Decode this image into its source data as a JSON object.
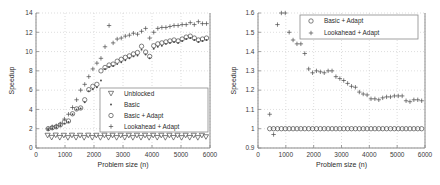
{
  "figure": {
    "title": "",
    "panel_count": 2
  },
  "chart_data": [
    {
      "type": "scatter",
      "panel": "left",
      "title": "",
      "xlabel": "Problem size (n)",
      "ylabel": "Speedup",
      "xlim": [
        0,
        6000
      ],
      "ylim": [
        0,
        14
      ],
      "xticks": [
        0,
        1000,
        2000,
        3000,
        4000,
        5000,
        6000
      ],
      "xticklabels": [
        "0",
        "1000",
        "2000",
        "3000",
        "4000",
        "5000",
        "6000"
      ],
      "yticks": [
        0,
        2,
        4,
        6,
        8,
        10,
        12,
        14
      ],
      "yticklabels": [
        "0",
        "2",
        "4",
        "6",
        "8",
        "10",
        "12",
        "14"
      ],
      "grid": true,
      "legend_position": "lower right",
      "legend": [
        "Unblocked",
        "Basic",
        "Basic + Adapt",
        "Lookahead + Adapt"
      ],
      "markers": [
        "triangle-down",
        "dot",
        "circle",
        "plus"
      ],
      "series": [
        {
          "name": "Unblocked",
          "marker": "triangle-down",
          "x": [
            400,
            540,
            680,
            820,
            960,
            1100,
            1240,
            1380,
            1520,
            1660,
            1800,
            1940,
            2080,
            2220,
            2360,
            2500,
            2640,
            2780,
            2920,
            3060,
            3200,
            3340,
            3480,
            3620,
            3760,
            3900,
            4040,
            4180,
            4320,
            4460,
            4600,
            4740,
            4880,
            5020,
            5160,
            5300,
            5440,
            5580,
            5720,
            5860
          ],
          "y": [
            1.3,
            1.08,
            1.32,
            1.07,
            1.3,
            1.06,
            1.31,
            1.07,
            1.3,
            1.06,
            1.31,
            1.07,
            1.3,
            1.06,
            1.31,
            1.07,
            1.3,
            1.06,
            1.3,
            1.07,
            1.3,
            1.06,
            1.3,
            1.07,
            1.3,
            1.06,
            1.3,
            1.07,
            1.3,
            1.06,
            1.3,
            1.07,
            1.3,
            1.06,
            1.3,
            1.07,
            1.3,
            1.06,
            1.3,
            1.15
          ]
        },
        {
          "name": "Basic",
          "marker": "dot",
          "x": [
            420,
            560,
            700,
            840,
            980,
            1120,
            1260,
            1400,
            1540,
            1680,
            1820,
            1960,
            2100,
            2240,
            2380,
            2520,
            2660,
            2800,
            2940,
            3080,
            3220,
            3360,
            3500,
            3640,
            3780,
            3920,
            4060,
            4200,
            4340,
            4480,
            4620,
            4760,
            4900,
            5040,
            5180,
            5320,
            5460,
            5600,
            5740,
            5880
          ],
          "y": [
            1.9,
            2.0,
            2.1,
            2.3,
            2.55,
            2.7,
            3.5,
            4.0,
            4.1,
            4.75,
            5.9,
            6.1,
            6.3,
            7.0,
            8.2,
            8.4,
            8.5,
            8.7,
            8.9,
            9.1,
            9.3,
            9.5,
            9.6,
            10.2,
            9.7,
            9.3,
            10.3,
            10.5,
            10.6,
            10.8,
            10.9,
            11.0,
            10.9,
            11.1,
            11.3,
            11.4,
            11.2,
            11.0,
            11.1,
            11.2
          ]
        },
        {
          "name": "Basic + Adapt",
          "marker": "circle",
          "x": [
            420,
            560,
            700,
            840,
            980,
            1120,
            1260,
            1400,
            1540,
            1680,
            1820,
            1960,
            2100,
            2240,
            2380,
            2520,
            2660,
            2800,
            2940,
            3080,
            3220,
            3360,
            3500,
            3640,
            3780,
            3920,
            4060,
            4200,
            4340,
            4480,
            4620,
            4760,
            4900,
            5040,
            5180,
            5320,
            5460,
            5600,
            5740,
            5880
          ],
          "y": [
            2.0,
            2.1,
            2.2,
            2.4,
            2.7,
            2.8,
            3.55,
            4.05,
            4.15,
            5.0,
            6.05,
            6.4,
            6.6,
            8.0,
            8.35,
            8.6,
            8.7,
            9.0,
            9.2,
            9.4,
            9.55,
            9.75,
            9.9,
            10.55,
            9.95,
            9.5,
            10.6,
            10.8,
            10.9,
            11.0,
            11.1,
            11.2,
            11.1,
            11.3,
            11.5,
            11.6,
            11.4,
            11.2,
            11.3,
            11.4
          ]
        },
        {
          "name": "Lookahead + Adapt",
          "marker": "plus",
          "x": [
            420,
            560,
            700,
            840,
            980,
            1120,
            1260,
            1400,
            1540,
            1680,
            1820,
            1960,
            2100,
            2240,
            2380,
            2520,
            2660,
            2800,
            2940,
            3080,
            3220,
            3360,
            3500,
            3640,
            3780,
            3920,
            4060,
            4200,
            4340,
            4480,
            4620,
            4760,
            4900,
            5040,
            5180,
            5320,
            5460,
            5600,
            5740,
            5880
          ],
          "y": [
            2.0,
            2.2,
            2.3,
            2.5,
            3.0,
            3.5,
            4.2,
            5.0,
            6.0,
            6.6,
            7.4,
            8.2,
            8.8,
            9.3,
            10.5,
            12.7,
            10.9,
            11.3,
            11.4,
            11.6,
            11.7,
            11.9,
            11.8,
            12.1,
            12.4,
            11.4,
            12.0,
            12.4,
            12.5,
            12.5,
            12.6,
            12.7,
            12.7,
            12.8,
            12.8,
            13.0,
            12.8,
            13.1,
            12.9,
            12.9
          ]
        }
      ]
    },
    {
      "type": "scatter",
      "panel": "right",
      "title": "",
      "xlabel": "Problem size (n)",
      "ylabel": "Speedup",
      "xlim": [
        0,
        6000
      ],
      "ylim": [
        0.9,
        1.6
      ],
      "xticks": [
        0,
        1000,
        2000,
        3000,
        4000,
        5000,
        6000
      ],
      "xticklabels": [
        "0",
        "1000",
        "2000",
        "3000",
        "4000",
        "5000",
        "6000"
      ],
      "yticks": [
        0.9,
        1.0,
        1.1,
        1.2,
        1.3,
        1.4,
        1.5,
        1.6
      ],
      "yticklabels": [
        "0.9",
        "1",
        "1.1",
        "1.2",
        "1.3",
        "1.4",
        "1.5",
        "1.6"
      ],
      "grid": true,
      "legend_position": "upper center",
      "legend": [
        "Basic + Adapt",
        "Lookahead + Adapt"
      ],
      "markers": [
        "circle",
        "plus"
      ],
      "series": [
        {
          "name": "Basic + Adapt",
          "marker": "circle",
          "x": [
            420,
            560,
            700,
            840,
            980,
            1120,
            1260,
            1400,
            1540,
            1680,
            1820,
            1960,
            2100,
            2240,
            2380,
            2520,
            2660,
            2800,
            2940,
            3080,
            3220,
            3360,
            3500,
            3640,
            3780,
            3920,
            4060,
            4200,
            4340,
            4480,
            4620,
            4760,
            4900,
            5040,
            5180,
            5320,
            5460,
            5600,
            5740,
            5880
          ],
          "y": [
            1.0,
            1.0,
            1.0,
            1.0,
            1.0,
            1.0,
            1.0,
            1.0,
            1.0,
            1.0,
            1.0,
            1.0,
            1.0,
            1.0,
            1.0,
            1.0,
            1.0,
            1.0,
            1.0,
            1.0,
            1.0,
            1.0,
            1.0,
            1.0,
            1.0,
            1.0,
            1.0,
            1.0,
            1.0,
            1.0,
            1.0,
            1.0,
            1.0,
            1.0,
            1.0,
            1.0,
            1.0,
            1.0,
            1.0,
            1.0
          ]
        },
        {
          "name": "Lookahead + Adapt",
          "marker": "plus",
          "x": [
            420,
            560,
            700,
            840,
            980,
            1120,
            1260,
            1400,
            1540,
            1680,
            1820,
            1960,
            2100,
            2240,
            2380,
            2520,
            2660,
            2800,
            2940,
            3080,
            3220,
            3360,
            3500,
            3640,
            3780,
            3920,
            4060,
            4200,
            4340,
            4480,
            4620,
            4760,
            4900,
            5040,
            5180,
            5320,
            5460,
            5600,
            5740,
            5880
          ],
          "y": [
            1.075,
            0.97,
            1.54,
            1.6,
            1.6,
            1.5,
            1.46,
            1.44,
            1.44,
            1.39,
            1.31,
            1.29,
            1.3,
            1.295,
            1.29,
            1.3,
            1.3,
            1.27,
            1.26,
            1.25,
            1.235,
            1.22,
            1.215,
            1.19,
            1.18,
            1.175,
            1.155,
            1.155,
            1.15,
            1.16,
            1.165,
            1.165,
            1.17,
            1.17,
            1.17,
            1.145,
            1.14,
            1.15,
            1.15,
            1.145
          ]
        }
      ]
    }
  ]
}
